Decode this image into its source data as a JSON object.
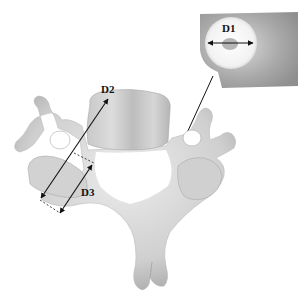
{
  "figure": {
    "labels": {
      "d1": "D1",
      "d2": "D2",
      "d3": "D3"
    },
    "inset": {
      "description": "magnified view of transverse foramen with diameter D1"
    },
    "colors": {
      "bone_light": "#e6e6e6",
      "bone_mid": "#c8c8c8",
      "bone_dark": "#9a9a9a",
      "line": "#111111",
      "background": "#ffffff"
    }
  }
}
